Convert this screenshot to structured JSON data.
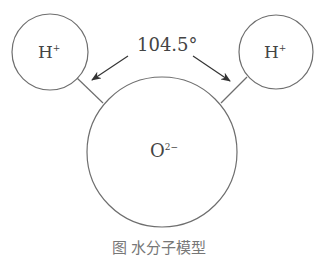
{
  "diagram": {
    "atoms": [
      {
        "id": "h-left",
        "symbol": "H",
        "charge": "+"
      },
      {
        "id": "o-center",
        "symbol": "O",
        "charge": "2−"
      },
      {
        "id": "h-right",
        "symbol": "H",
        "charge": "+"
      }
    ],
    "angle_label": "104.5°",
    "caption": "图 水分子模型"
  },
  "colors": {
    "stroke": "#6e6e6e",
    "text": "#444444",
    "arrow": "#333333"
  }
}
